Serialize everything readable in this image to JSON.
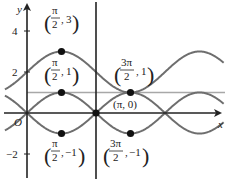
{
  "figure": {
    "axes": {
      "x_label": "x",
      "y_label": "y",
      "origin_label": "O",
      "y_ticks": [
        {
          "value": 4,
          "label": "4"
        },
        {
          "value": 2,
          "label": "2"
        },
        {
          "value": -2,
          "label": "−2"
        }
      ],
      "origin_px": [
        27,
        113
      ],
      "px_per_pi": 69,
      "px_per_unit_y": 20.5
    },
    "curves": [
      {
        "name": "y = 2 + sin x",
        "expr": "2+sin",
        "color": "#6e6e6e"
      },
      {
        "name": "y = sin x",
        "expr": "sin",
        "color": "#6e6e6e"
      },
      {
        "name": "y = -sin x",
        "expr": "-sin",
        "color": "#6e6e6e"
      }
    ],
    "horizontal_line": {
      "y": 1,
      "color": "#a8a8a8"
    },
    "vertical_line": {
      "x_label": "π",
      "color": "#222222"
    },
    "points": [
      {
        "x_pi": 0.5,
        "y": 3,
        "label_num": "π",
        "label_den": "2",
        "label_y": "3"
      },
      {
        "x_pi": 0.5,
        "y": 1,
        "label_num": "π",
        "label_den": "2",
        "label_y": "1"
      },
      {
        "x_pi": 0.5,
        "y": -1,
        "label_num": "π",
        "label_den": "2",
        "label_y": "−1"
      },
      {
        "x_pi": 1.5,
        "y": 1,
        "label_num": "3π",
        "label_den": "2",
        "label_y": "1"
      },
      {
        "x_pi": 1.5,
        "y": -1,
        "label_num": "3π",
        "label_den": "2",
        "label_y": "−1"
      },
      {
        "x_pi": 1,
        "y": 0,
        "label": "(π, 0)"
      }
    ],
    "colors": {
      "axis": "#222222",
      "curve": "#6e6e6e",
      "hline": "#a8a8a8",
      "point": "#111111"
    }
  }
}
